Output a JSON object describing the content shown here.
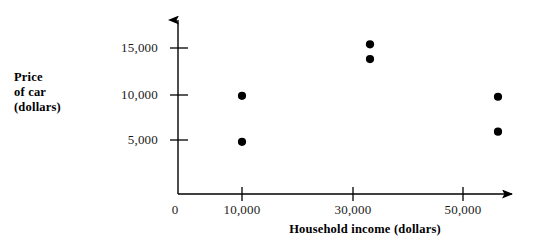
{
  "chart_data": {
    "type": "scatter",
    "title": "",
    "xlabel": "Household income (dollars)",
    "ylabel": "Price\nof car\n(dollars)",
    "ylabel_lines": [
      "Price",
      "of car",
      "(dollars)"
    ],
    "xlim": [
      0,
      62000
    ],
    "ylim": [
      0,
      18500
    ],
    "grid": false,
    "legend": "none",
    "xticks": [
      0,
      10000,
      30000,
      50000
    ],
    "xtick_labels": [
      "0",
      "10,000",
      "30,000",
      "50,000"
    ],
    "yticks": [
      5000,
      10000,
      15000
    ],
    "ytick_labels": [
      "5,000",
      "10,000",
      "15,000"
    ],
    "marker": "filled-circle",
    "marker_color": "#000000",
    "points": [
      {
        "x": 10000,
        "y": 9800
      },
      {
        "x": 10000,
        "y": 4800
      },
      {
        "x": 30000,
        "y": 15400
      },
      {
        "x": 30000,
        "y": 13800
      },
      {
        "x": 50000,
        "y": 9700
      },
      {
        "x": 50000,
        "y": 5900
      }
    ],
    "axis_style": "arrowed-open-axes",
    "axis_color": "#000000"
  },
  "axes": {
    "x_title": "Household income (dollars)",
    "y_title_line1": "Price",
    "y_title_line2": "of car",
    "y_title_line3": "(dollars)",
    "x_tick_0": "0",
    "x_tick_1": "10,000",
    "x_tick_2": "30,000",
    "x_tick_3": "50,000",
    "y_tick_0": "5,000",
    "y_tick_1": "10,000",
    "y_tick_2": "15,000"
  }
}
